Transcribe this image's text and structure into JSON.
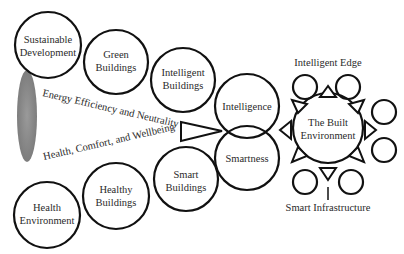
{
  "diagram": {
    "type": "concept-map",
    "colors": {
      "stroke": "#111111",
      "ellipse": "#8c8c8c",
      "text": "#2a2a2a",
      "background": "#ffffff"
    },
    "top_chain": [
      {
        "line1": "Sustainable",
        "line2": "Development"
      },
      {
        "line1": "Green",
        "line2": "Buildings"
      },
      {
        "line1": "Intelligent",
        "line2": "Buildings"
      }
    ],
    "bottom_chain": [
      {
        "line1": "Health",
        "line2": "Environment"
      },
      {
        "line1": "Healthy",
        "line2": "Buildings"
      },
      {
        "line1": "Smart",
        "line2": "Buildings"
      }
    ],
    "center": {
      "upper": "Intelligence",
      "lower": "Smartness"
    },
    "flows": {
      "upper": "Energy Efficiency and Neutrality",
      "lower": "Health, Comfort, and Wellbeing"
    },
    "hub": {
      "line1": "The Built",
      "line2": "Environment"
    },
    "edge_label": "Intelligent Edge",
    "infra_label": "Smart Infrastructure"
  }
}
